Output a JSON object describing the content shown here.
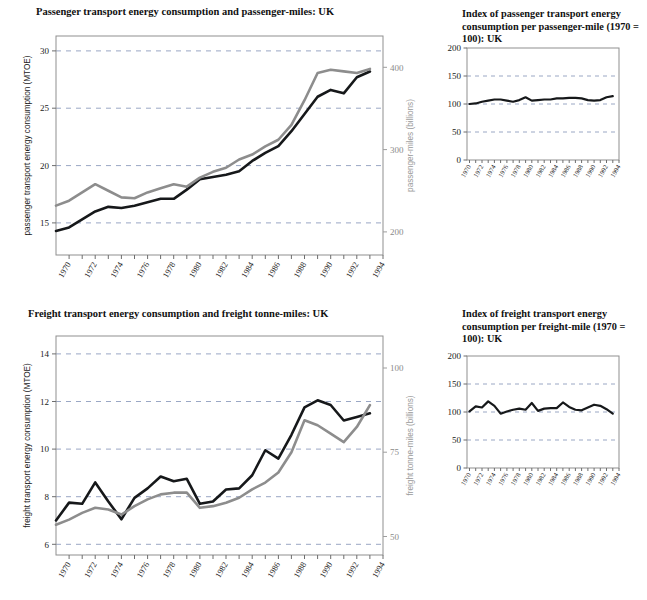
{
  "figure": {
    "background": "#ffffff",
    "series_colors": {
      "dark": "#16181a",
      "grey": "#8d8d8d"
    },
    "grid_color": "#9aa7c4"
  },
  "panels": {
    "top_left": {
      "title": "Passenger transport energy consumption and passenger-miles: UK"
    },
    "top_right": {
      "title": "Index of passenger transport energy consumption per passenger-mile (1970 = 100): UK"
    },
    "bottom_left": {
      "title": "Freight transport energy consumption and freight tonne-miles: UK"
    },
    "bottom_right": {
      "title": "Index of freight transport energy consumption per freight-mile (1970 = 100): UK"
    }
  },
  "chart_data": [
    {
      "id": "passenger-energy-and-miles",
      "type": "line",
      "title": "Passenger transport energy consumption and passenger-miles: UK",
      "xlabel": "",
      "ylabel": "passenger transport energy consumption (MTOE)",
      "y2label": "passenger-miles (billions)",
      "xlim": [
        1969,
        1994
      ],
      "ylim": [
        12.2,
        31.3
      ],
      "y2lim": [
        172,
        438
      ],
      "yticks": [
        15,
        20,
        25,
        30
      ],
      "y2ticks": [
        200,
        300,
        400
      ],
      "xticks": [
        1970,
        1972,
        1974,
        1976,
        1978,
        1980,
        1982,
        1984,
        1986,
        1988,
        1990,
        1992,
        1994
      ],
      "grid": true,
      "x": [
        1969,
        1970,
        1971,
        1972,
        1973,
        1974,
        1975,
        1976,
        1977,
        1978,
        1979,
        1980,
        1981,
        1982,
        1983,
        1984,
        1985,
        1986,
        1987,
        1988,
        1989,
        1990,
        1991,
        1992,
        1993
      ],
      "series": [
        {
          "name": "passenger transport energy consumption (MTOE)",
          "axis": "left",
          "color": "#16181a",
          "values": [
            14.3,
            14.6,
            15.3,
            16.0,
            16.4,
            16.3,
            16.5,
            16.8,
            17.1,
            17.1,
            17.9,
            18.8,
            19.0,
            19.2,
            19.5,
            20.4,
            21.1,
            21.7,
            23.0,
            24.5,
            26.0,
            26.6,
            26.3,
            27.7,
            28.2,
            28.3
          ]
        },
        {
          "name": "passenger-miles (billions)",
          "axis": "right",
          "color": "#8d8d8d",
          "values": [
            232,
            238,
            248,
            258,
            250,
            242,
            241,
            248,
            253,
            258,
            255,
            266,
            273,
            278,
            288,
            294,
            304,
            312,
            330,
            360,
            393,
            397,
            395,
            393,
            398
          ]
        }
      ]
    },
    {
      "id": "index-passenger-energy-per-passenger-mile",
      "type": "line",
      "title": "Index of passenger transport energy consumption per passenger-mile (1970 = 100): UK",
      "xlabel": "",
      "ylabel": "",
      "ylim": [
        0,
        200
      ],
      "yticks": [
        0,
        50,
        100,
        150,
        200
      ],
      "xticks": [
        1970,
        1972,
        1974,
        1976,
        1978,
        1980,
        1982,
        1984,
        1986,
        1988,
        1990,
        1992,
        1994
      ],
      "grid": true,
      "x": [
        1970,
        1971,
        1972,
        1973,
        1974,
        1975,
        1976,
        1977,
        1978,
        1979,
        1980,
        1981,
        1982,
        1983,
        1984,
        1985,
        1986,
        1987,
        1988,
        1989,
        1990,
        1991,
        1992,
        1993
      ],
      "series": [
        {
          "name": "index (1970 = 100)",
          "axis": "left",
          "color": "#16181a",
          "values": [
            100,
            101,
            104,
            106,
            108,
            108,
            106,
            104,
            107,
            112,
            106,
            107,
            108,
            108,
            110,
            110,
            111,
            111,
            110,
            107,
            106,
            107,
            112,
            114,
            113
          ]
        }
      ]
    },
    {
      "id": "freight-energy-and-tonne-miles",
      "type": "line",
      "title": "Freight transport energy consumption and freight tonne-miles: UK",
      "xlabel": "",
      "ylabel": "freight transport energy consumption (MTOE)",
      "y2label": "freight tonne-miles (billions)",
      "xlim": [
        1969,
        1994
      ],
      "ylim": [
        5.55,
        14.75
      ],
      "y2lim": [
        44.5,
        109.5
      ],
      "yticks": [
        6,
        8,
        10,
        12,
        14
      ],
      "y2ticks": [
        50,
        75,
        100
      ],
      "xticks": [
        1970,
        1972,
        1974,
        1976,
        1978,
        1980,
        1982,
        1984,
        1986,
        1988,
        1990,
        1992,
        1994
      ],
      "grid": true,
      "x": [
        1969,
        1970,
        1971,
        1972,
        1973,
        1974,
        1975,
        1976,
        1977,
        1978,
        1979,
        1980,
        1981,
        1982,
        1983,
        1984,
        1985,
        1986,
        1987,
        1988,
        1989,
        1990,
        1991,
        1992,
        1993
      ],
      "series": [
        {
          "name": "freight transport energy consumption (MTOE)",
          "axis": "left",
          "color": "#16181a",
          "values": [
            7.0,
            7.75,
            7.7,
            8.6,
            7.8,
            7.05,
            7.95,
            8.35,
            8.85,
            8.65,
            8.75,
            7.7,
            7.8,
            8.3,
            8.35,
            8.9,
            9.95,
            9.6,
            10.6,
            11.75,
            12.05,
            11.85,
            11.2,
            11.35,
            11.5
          ]
        },
        {
          "name": "freight tonne-miles (billions)",
          "axis": "right",
          "color": "#8d8d8d",
          "values": [
            53.5,
            55.0,
            57.0,
            58.5,
            58.0,
            56.5,
            59.0,
            61.0,
            62.5,
            63.0,
            63.0,
            58.5,
            59.0,
            60.0,
            61.5,
            64.0,
            66.0,
            69.0,
            75.0,
            84.5,
            83.0,
            80.5,
            78.0,
            82.5,
            89.0
          ]
        }
      ]
    },
    {
      "id": "index-freight-energy-per-freight-mile",
      "type": "line",
      "title": "Index of freight transport energy consumption per freight-mile (1970 = 100): UK",
      "xlabel": "",
      "ylabel": "",
      "ylim": [
        0,
        200
      ],
      "yticks": [
        0,
        50,
        100,
        150,
        200
      ],
      "xticks": [
        1970,
        1972,
        1974,
        1976,
        1978,
        1980,
        1982,
        1984,
        1986,
        1988,
        1990,
        1992,
        1994
      ],
      "grid": true,
      "x": [
        1970,
        1971,
        1972,
        1973,
        1974,
        1975,
        1976,
        1977,
        1978,
        1979,
        1980,
        1981,
        1982,
        1983,
        1984,
        1985,
        1986,
        1987,
        1988,
        1989,
        1990,
        1991,
        1992,
        1993
      ],
      "series": [
        {
          "name": "index (1970 = 100)",
          "axis": "left",
          "color": "#16181a",
          "values": [
            101,
            110,
            108,
            119,
            111,
            97,
            101,
            104,
            106,
            104,
            116,
            102,
            106,
            107,
            107,
            117,
            109,
            104,
            103,
            108,
            113,
            111,
            105,
            97
          ]
        }
      ]
    }
  ],
  "axes_text": {
    "passenger_left_ticks": [
      "15",
      "20",
      "25",
      "30"
    ],
    "passenger_right_ticks": [
      "200",
      "300",
      "400"
    ],
    "passenger_left_title": "passenger transport energy consumption (MTOE)",
    "passenger_right_title": "passenger-miles (billions)",
    "freight_left_ticks": [
      "6",
      "8",
      "10",
      "12",
      "14"
    ],
    "freight_right_ticks": [
      "50",
      "75",
      "100"
    ],
    "freight_left_title": "freight transport energy consumption (MTOE)",
    "freight_right_title": "freight tonne-miles (billions)",
    "index_ticks": [
      "0",
      "50",
      "100",
      "150",
      "200"
    ],
    "years": [
      "1970",
      "1972",
      "1974",
      "1976",
      "1978",
      "1980",
      "1982",
      "1984",
      "1986",
      "1988",
      "1990",
      "1992",
      "1994"
    ]
  }
}
